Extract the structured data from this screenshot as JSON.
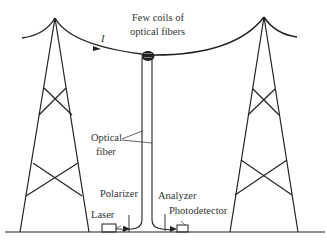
{
  "diagram": {
    "title_label": "Few coils of",
    "title_label_line2": "optical fibers",
    "current_label": "I",
    "fiber_label_line1": "Optical",
    "fiber_label_line2": "fiber",
    "polarizer_label": "Polarizer",
    "laser_label": "Laser",
    "analyzer_label": "Analyzer",
    "photodetector_label": "Photodetector",
    "colors": {
      "line": "#222222",
      "text": "#333333",
      "background": "#ffffff"
    }
  }
}
